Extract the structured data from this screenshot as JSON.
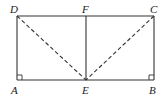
{
  "diagram": {
    "type": "geometry",
    "shape": "rectangle ABCD with point E on AB and F on DC",
    "points": {
      "A": {
        "label": "A",
        "x": 17,
        "y": 80
      },
      "B": {
        "label": "B",
        "x": 154,
        "y": 80
      },
      "C": {
        "label": "C",
        "x": 154,
        "y": 16
      },
      "D": {
        "label": "D",
        "x": 17,
        "y": 16
      },
      "E": {
        "label": "E",
        "x": 86,
        "y": 80
      },
      "F": {
        "label": "F",
        "x": 86,
        "y": 16
      }
    },
    "solid_segments": [
      "AB",
      "BC",
      "CD",
      "DA",
      "EF"
    ],
    "dashed_segments": [
      "DE",
      "CE"
    ],
    "right_angles": [
      "A",
      "B"
    ],
    "colors": {
      "line": "#333333",
      "background": "#ffffff"
    }
  }
}
